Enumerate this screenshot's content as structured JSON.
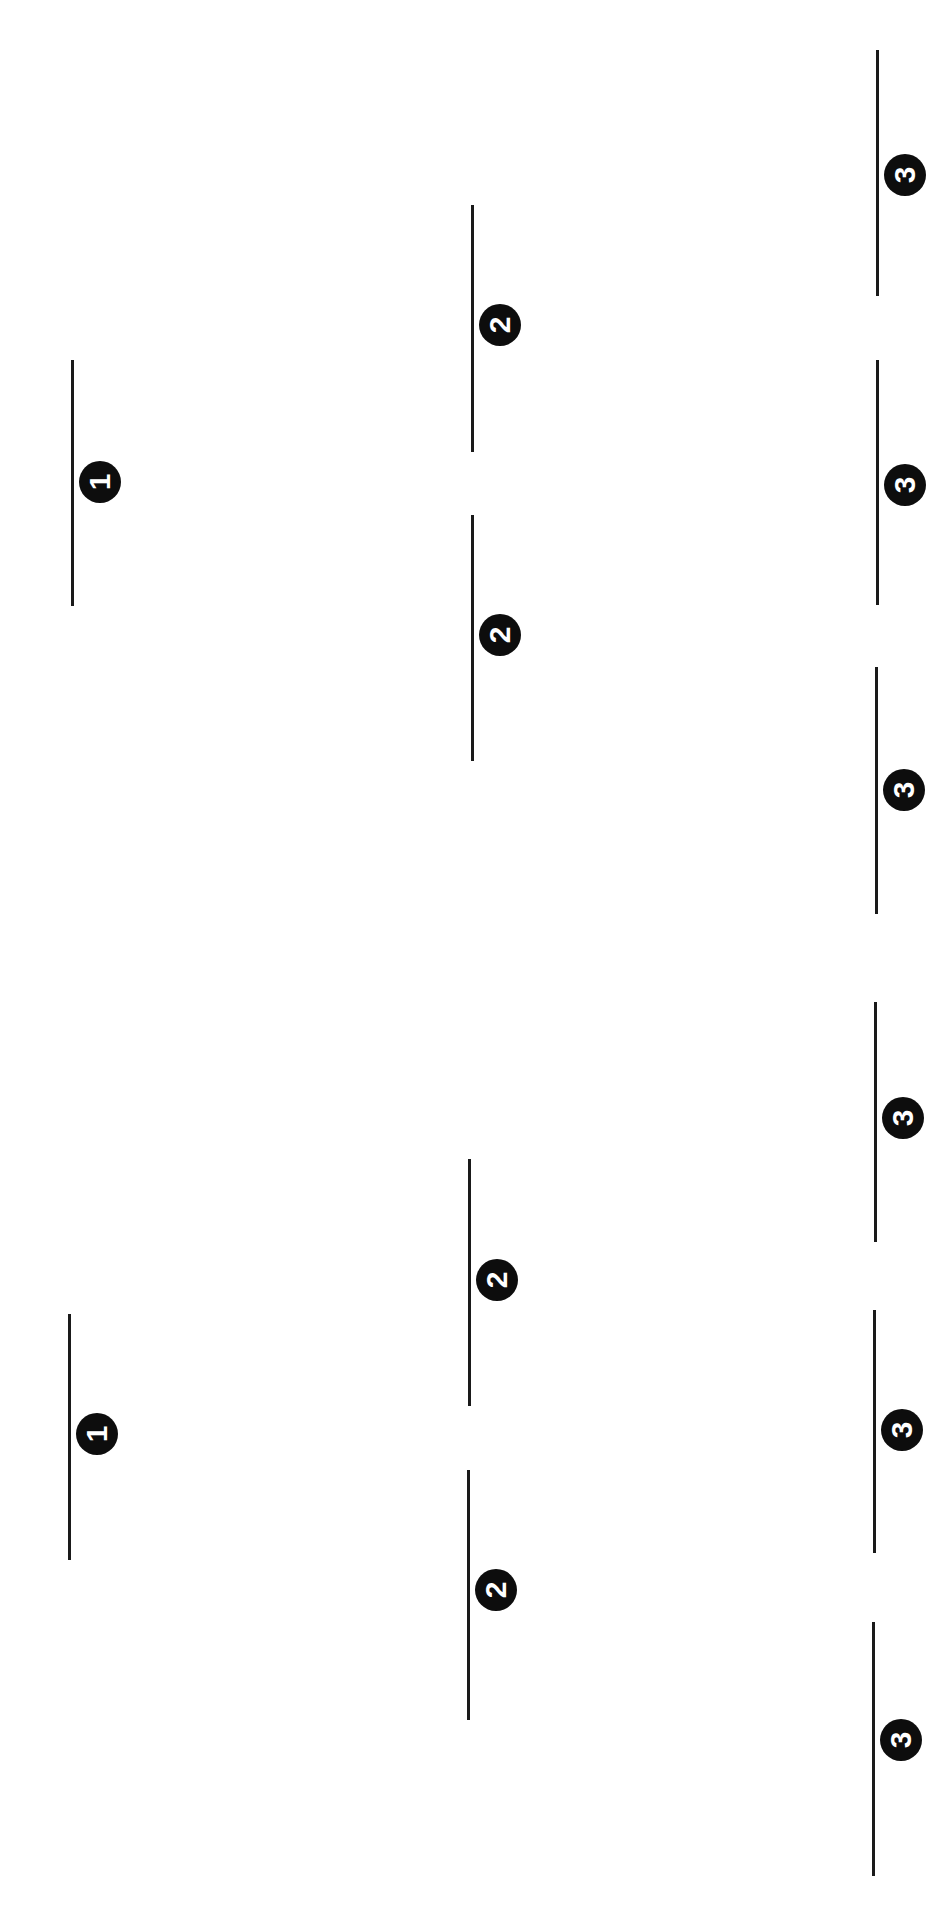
{
  "diagram": {
    "type": "tournament-bracket",
    "orientation": "rotated-90",
    "line_color": "#1a1a1a",
    "badge_color": "#0d0d0d",
    "badge_text_color": "#ffffff",
    "columns": [
      {
        "round": "1",
        "slots": [
          {
            "label": "1",
            "x": 71,
            "y": 360,
            "height": 246,
            "badge_cy": 482
          },
          {
            "label": "1",
            "x": 68,
            "y": 1314,
            "height": 246,
            "badge_cy": 1434
          }
        ]
      },
      {
        "round": "2",
        "slots": [
          {
            "label": "2",
            "x": 471,
            "y": 205,
            "height": 247,
            "badge_cy": 325
          },
          {
            "label": "2",
            "x": 471,
            "y": 515,
            "height": 246,
            "badge_cy": 635
          },
          {
            "label": "2",
            "x": 468,
            "y": 1159,
            "height": 247,
            "badge_cy": 1280
          },
          {
            "label": "2",
            "x": 467,
            "y": 1470,
            "height": 250,
            "badge_cy": 1590
          }
        ]
      },
      {
        "round": "3",
        "slots": [
          {
            "label": "3",
            "x": 876,
            "y": 50,
            "height": 246,
            "badge_cy": 175
          },
          {
            "label": "3",
            "x": 876,
            "y": 360,
            "height": 245,
            "badge_cy": 485
          },
          {
            "label": "3",
            "x": 875,
            "y": 667,
            "height": 247,
            "badge_cy": 790
          },
          {
            "label": "3",
            "x": 874,
            "y": 1002,
            "height": 240,
            "badge_cy": 1118
          },
          {
            "label": "3",
            "x": 873,
            "y": 1310,
            "height": 243,
            "badge_cy": 1430
          },
          {
            "label": "3",
            "x": 872,
            "y": 1622,
            "height": 254,
            "badge_cy": 1740
          }
        ]
      }
    ]
  }
}
